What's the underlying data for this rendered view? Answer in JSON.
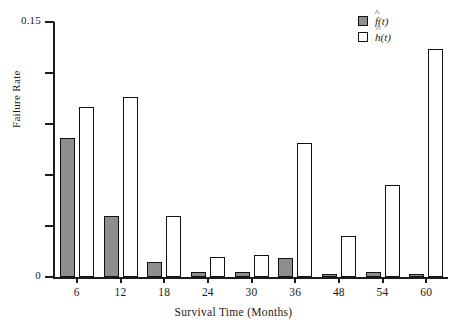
{
  "chart_data": {
    "type": "bar",
    "title": "",
    "subtitle": "",
    "xlabel": "Survival Time (Months)",
    "ylabel": "Failure Rate",
    "categories": [
      "6",
      "12",
      "18",
      "24",
      "30",
      "36",
      "48",
      "54",
      "60"
    ],
    "series": [
      {
        "name": "f-hat-t",
        "legend_label": "f(t)",
        "legend_symbol": "f",
        "color": "#8e8e8e",
        "values": [
          0.082,
          0.036,
          0.009,
          0.003,
          0.003,
          0.011,
          0.002,
          0.003,
          0.002
        ]
      },
      {
        "name": "h-hat-t",
        "legend_label": "h(t)",
        "legend_symbol": "h",
        "color": "#ffffff",
        "values": [
          0.1,
          0.106,
          0.036,
          0.012,
          0.013,
          0.079,
          0.024,
          0.054,
          0.134
        ]
      }
    ],
    "ylim": [
      0,
      0.15
    ],
    "yticks": [
      0,
      0.03,
      0.06,
      0.09,
      0.12,
      0.15
    ],
    "ytick_labels": [
      "0",
      "",
      "",
      "",
      "",
      "0.15"
    ],
    "grid": false,
    "legend_position": "top-right"
  },
  "axes": {
    "y_title": "Failure Rate",
    "x_title": "Survival Time (Months)",
    "y_label_top": "0.15",
    "y_label_bottom": "0"
  },
  "legend": {
    "entries": [
      {
        "symbol": "f",
        "arg": "(t)"
      },
      {
        "symbol": "h",
        "arg": "(t)"
      }
    ]
  }
}
